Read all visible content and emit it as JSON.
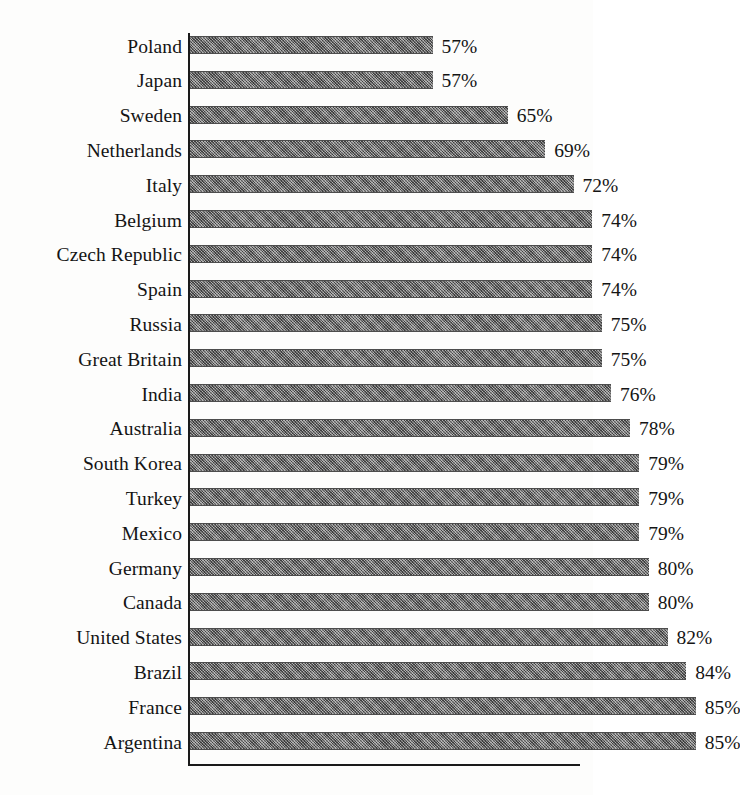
{
  "chart_data": {
    "type": "bar",
    "orientation": "horizontal",
    "title": "",
    "subtitle": "",
    "xlabel": "",
    "ylabel": "",
    "grid": false,
    "legend": null,
    "value_suffix": "%",
    "axis_note": "value axis is offset; bars are drawn from a non-zero origin near 31%",
    "xlim": [
      31,
      88
    ],
    "categories": [
      "Poland",
      "Japan",
      "Sweden",
      "Netherlands",
      "Italy",
      "Belgium",
      "Czech Republic",
      "Spain",
      "Russia",
      "Great Britain",
      "India",
      "Australia",
      "South Korea",
      "Turkey",
      "Mexico",
      "Germany",
      "Canada",
      "United States",
      "Brazil",
      "France",
      "Argentina"
    ],
    "values": [
      57,
      57,
      65,
      69,
      72,
      74,
      74,
      74,
      75,
      75,
      76,
      78,
      79,
      79,
      79,
      80,
      80,
      82,
      84,
      85,
      85
    ],
    "value_labels": [
      "57%",
      "57%",
      "65%",
      "69%",
      "72%",
      "74%",
      "74%",
      "74%",
      "75%",
      "75%",
      "76%",
      "78%",
      "79%",
      "79%",
      "79%",
      "80%",
      "80%",
      "82%",
      "84%",
      "85%",
      "85%"
    ],
    "colors": {
      "bar_fill": "#7c7c7c",
      "bar_edge": "#4d4d4d",
      "axis": "#1a1a1a",
      "text": "#141414",
      "background": "#fdfdfc"
    }
  }
}
